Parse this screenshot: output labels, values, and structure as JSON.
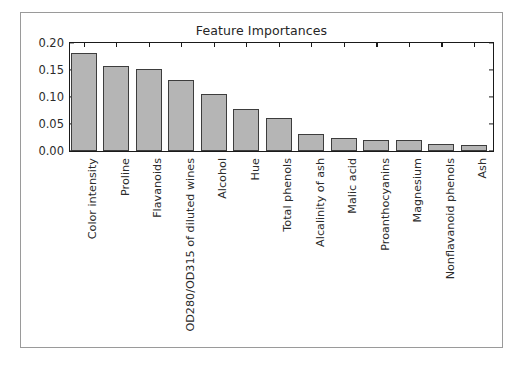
{
  "figure": {
    "background_color": "#ffffff",
    "border_color": "#9a9a9a"
  },
  "chart_data": {
    "type": "bar",
    "title": "Feature Importances",
    "xlabel": "",
    "ylabel": "",
    "ylim": [
      0.0,
      0.2
    ],
    "yticks": [
      "0.00",
      "0.05",
      "0.10",
      "0.15",
      "0.20"
    ],
    "ytick_values": [
      0.0,
      0.05,
      0.1,
      0.15,
      0.2
    ],
    "grid": false,
    "legend": null,
    "bar_fill_color": "#b5b5b5",
    "bar_edge_color": "#3d3d3d",
    "categories": [
      "Color intensity",
      "Proline",
      "Flavanoids",
      "OD280/OD315 of diluted wines",
      "Alcohol",
      "Hue",
      "Total phenols",
      "Alcalinity of ash",
      "Malic acid",
      "Proanthocyanins",
      "Magnesium",
      "Nonflavanoid phenols",
      "Ash"
    ],
    "values": [
      0.182,
      0.158,
      0.151,
      0.131,
      0.106,
      0.078,
      0.061,
      0.031,
      0.024,
      0.021,
      0.02,
      0.013,
      0.012
    ]
  }
}
